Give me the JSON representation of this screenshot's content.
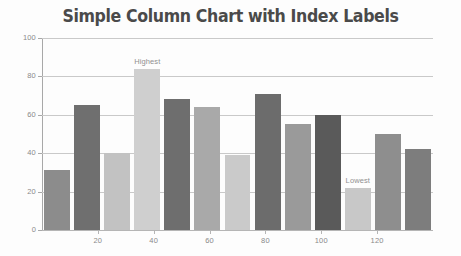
{
  "chart_data": {
    "type": "bar",
    "title": "Simple Column Chart with Index Labels",
    "xlabel": "",
    "ylabel": "",
    "ylim": [
      0,
      100
    ],
    "xlim": [
      0,
      140
    ],
    "grid": true,
    "legend": "none",
    "y_ticks": [
      0,
      20,
      40,
      60,
      80,
      100
    ],
    "x_ticks": [
      20,
      40,
      60,
      80,
      100,
      120
    ],
    "x": [
      10,
      20,
      30,
      40,
      50,
      60,
      70,
      80,
      90,
      100,
      110,
      120,
      130
    ],
    "values": [
      31,
      65,
      40,
      84,
      68,
      64,
      39,
      71,
      55,
      60,
      22,
      50,
      42
    ],
    "bar_colors": [
      "#8c8c8c",
      "#6f6f6f",
      "#c2c2c2",
      "#cfcfcf",
      "#6e6e6e",
      "#a9a9a9",
      "#cacaca",
      "#6c6c6c",
      "#9a9a9a",
      "#5a5a5a",
      "#c8c8c8",
      "#8e8e8e",
      "#7d7d7d"
    ],
    "annotations": [
      {
        "label": "Highest",
        "index": 3,
        "value": 84
      },
      {
        "label": "Lowest",
        "index": 10,
        "value": 22
      }
    ],
    "title_color": "#4a4a4a",
    "grid_color": "#c9c9c9",
    "axis_color": "#a8a8a8",
    "tick_label_color": "#8a8a8a",
    "annotation_color": "#909090",
    "background": "#fdfdfd"
  }
}
